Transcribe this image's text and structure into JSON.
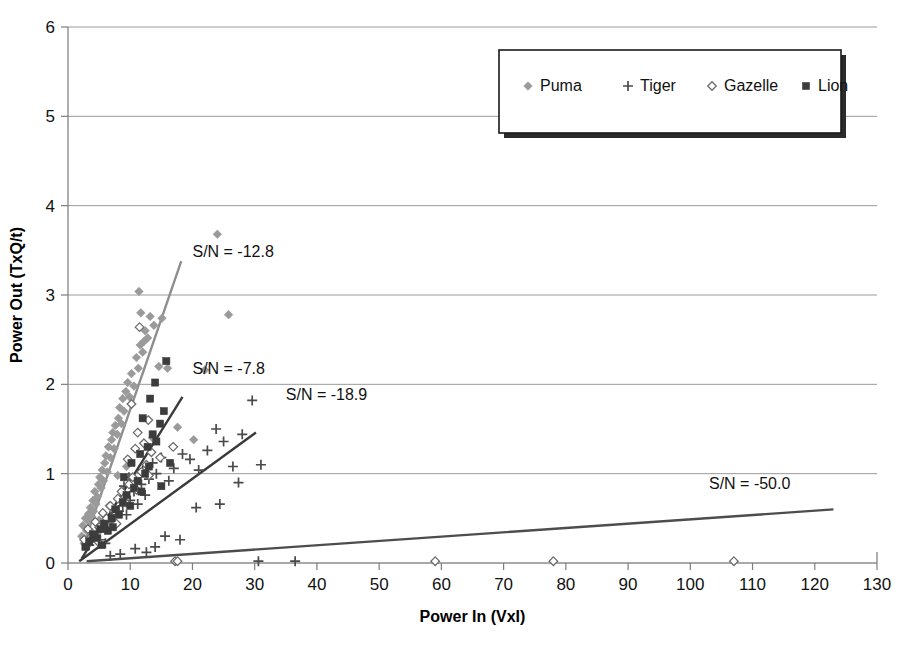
{
  "chart_data": {
    "type": "scatter",
    "title": "",
    "subtitle": "",
    "xlabel": "Power In (VxI)",
    "ylabel": "Power Out (TxQ/t)",
    "xlim": [
      0,
      130
    ],
    "ylim": [
      0,
      6
    ],
    "xticks": [
      0,
      10,
      20,
      30,
      40,
      50,
      60,
      70,
      80,
      90,
      100,
      110,
      120,
      130
    ],
    "yticks": [
      0,
      1,
      2,
      3,
      4,
      5,
      6
    ],
    "xtick_labels": [
      "0",
      "10",
      "20",
      "30",
      "40",
      "50",
      "60",
      "70",
      "80",
      "90",
      "100",
      "110",
      "120",
      "130"
    ],
    "ytick_labels": [
      "0",
      "1",
      "2",
      "3",
      "4",
      "5",
      "6"
    ],
    "grid": "horizontal",
    "legend_position": "top-right",
    "legend_entries": [
      {
        "label": "Puma",
        "marker": "filled-diamond",
        "color": "#9a9a9a"
      },
      {
        "label": "Tiger",
        "marker": "plus",
        "color": "#4a4a4a"
      },
      {
        "label": "Gazelle",
        "marker": "open-diamond",
        "color": "#6b6b6b"
      },
      {
        "label": "Lion",
        "marker": "filled-square",
        "color": "#3c3c3c"
      }
    ],
    "series": [
      {
        "name": "Puma",
        "marker": "filled-diamond",
        "color": "#9a9a9a",
        "points": [
          [
            2.2,
            0.3
          ],
          [
            2.4,
            0.42
          ],
          [
            2.6,
            0.22
          ],
          [
            2.8,
            0.5
          ],
          [
            3.0,
            0.36
          ],
          [
            3.1,
            0.28
          ],
          [
            3.3,
            0.55
          ],
          [
            3.4,
            0.46
          ],
          [
            3.6,
            0.62
          ],
          [
            3.8,
            0.52
          ],
          [
            4.0,
            0.7
          ],
          [
            4.1,
            0.58
          ],
          [
            4.3,
            0.8
          ],
          [
            4.5,
            0.66
          ],
          [
            4.7,
            0.74
          ],
          [
            4.9,
            0.88
          ],
          [
            5.1,
            0.96
          ],
          [
            5.3,
            0.84
          ],
          [
            5.5,
            1.04
          ],
          [
            5.7,
            0.92
          ],
          [
            5.9,
            1.12
          ],
          [
            6.1,
            1.2
          ],
          [
            6.3,
            1.02
          ],
          [
            6.5,
            1.3
          ],
          [
            6.8,
            1.18
          ],
          [
            7.0,
            1.38
          ],
          [
            7.2,
            1.46
          ],
          [
            7.4,
            1.28
          ],
          [
            7.6,
            1.54
          ],
          [
            7.9,
            1.44
          ],
          [
            8.1,
            1.62
          ],
          [
            8.3,
            1.74
          ],
          [
            8.6,
            1.56
          ],
          [
            8.8,
            1.84
          ],
          [
            9.0,
            1.7
          ],
          [
            9.3,
            1.92
          ],
          [
            9.6,
            2.02
          ],
          [
            9.9,
            1.86
          ],
          [
            10.2,
            2.12
          ],
          [
            10.6,
            1.98
          ],
          [
            11.0,
            2.3
          ],
          [
            11.3,
            2.18
          ],
          [
            11.6,
            2.44
          ],
          [
            12.0,
            2.36
          ],
          [
            12.4,
            2.6
          ],
          [
            12.8,
            2.52
          ],
          [
            13.2,
            2.76
          ],
          [
            13.8,
            2.66
          ],
          [
            11.4,
            3.04
          ],
          [
            11.7,
            2.8
          ],
          [
            12.2,
            2.48
          ],
          [
            14.6,
            2.2
          ],
          [
            16.0,
            2.18
          ],
          [
            15.1,
            2.74
          ],
          [
            17.6,
            1.52
          ],
          [
            20.2,
            1.38
          ],
          [
            24.0,
            3.68
          ],
          [
            25.8,
            2.78
          ],
          [
            22.0,
            2.16
          ],
          [
            13.6,
            1.4
          ],
          [
            9.4,
            1.08
          ],
          [
            8.0,
            0.98
          ],
          [
            6.6,
            0.64
          ],
          [
            5.0,
            0.48
          ],
          [
            3.9,
            0.34
          ]
        ]
      },
      {
        "name": "Tiger",
        "marker": "plus",
        "color": "#4a4a4a",
        "points": [
          [
            3.4,
            0.2
          ],
          [
            4.0,
            0.28
          ],
          [
            4.6,
            0.34
          ],
          [
            5.2,
            0.26
          ],
          [
            5.8,
            0.4
          ],
          [
            6.4,
            0.46
          ],
          [
            6.0,
            0.22
          ],
          [
            7.0,
            0.52
          ],
          [
            7.6,
            0.44
          ],
          [
            8.2,
            0.58
          ],
          [
            8.8,
            0.64
          ],
          [
            9.4,
            0.54
          ],
          [
            10.0,
            0.7
          ],
          [
            10.6,
            0.8
          ],
          [
            11.2,
            0.66
          ],
          [
            11.8,
            0.88
          ],
          [
            12.4,
            0.76
          ],
          [
            13.0,
            0.94
          ],
          [
            9.0,
            0.86
          ],
          [
            9.8,
            0.96
          ],
          [
            12.0,
            1.04
          ],
          [
            13.6,
            1.12
          ],
          [
            14.2,
            1.0
          ],
          [
            15.0,
            1.18
          ],
          [
            16.2,
            0.92
          ],
          [
            17.0,
            1.06
          ],
          [
            18.4,
            1.22
          ],
          [
            19.6,
            1.16
          ],
          [
            21.0,
            1.04
          ],
          [
            22.4,
            1.26
          ],
          [
            23.8,
            1.5
          ],
          [
            25.0,
            1.36
          ],
          [
            26.5,
            1.08
          ],
          [
            28.0,
            1.44
          ],
          [
            29.6,
            1.82
          ],
          [
            31.0,
            1.1
          ],
          [
            27.4,
            0.9
          ],
          [
            24.4,
            0.66
          ],
          [
            20.6,
            0.62
          ],
          [
            18.0,
            0.26
          ],
          [
            15.6,
            0.3
          ],
          [
            14.0,
            0.18
          ],
          [
            12.6,
            0.12
          ],
          [
            10.8,
            0.16
          ],
          [
            8.4,
            0.1
          ],
          [
            6.8,
            0.08
          ],
          [
            30.6,
            0.02
          ],
          [
            36.5,
            0.02
          ]
        ]
      },
      {
        "name": "Gazelle",
        "marker": "open-diamond",
        "color": "#6b6b6b",
        "points": [
          [
            2.6,
            0.26
          ],
          [
            3.2,
            0.38
          ],
          [
            3.8,
            0.3
          ],
          [
            4.4,
            0.46
          ],
          [
            5.0,
            0.4
          ],
          [
            5.6,
            0.56
          ],
          [
            6.2,
            0.5
          ],
          [
            6.8,
            0.64
          ],
          [
            7.4,
            0.58
          ],
          [
            8.0,
            0.72
          ],
          [
            8.6,
            0.8
          ],
          [
            9.2,
            0.68
          ],
          [
            9.8,
            0.88
          ],
          [
            10.4,
            0.96
          ],
          [
            11.0,
            0.82
          ],
          [
            11.8,
            1.02
          ],
          [
            12.6,
            1.1
          ],
          [
            9.6,
            1.16
          ],
          [
            10.8,
            1.28
          ],
          [
            12.2,
            1.34
          ],
          [
            13.4,
            1.24
          ],
          [
            11.2,
            1.46
          ],
          [
            12.9,
            1.6
          ],
          [
            10.2,
            1.78
          ],
          [
            11.5,
            2.64
          ],
          [
            16.9,
            1.3
          ],
          [
            14.8,
            1.18
          ],
          [
            13.0,
            0.98
          ],
          [
            7.8,
            0.44
          ],
          [
            4.8,
            0.24
          ],
          [
            17.2,
            0.02
          ],
          [
            17.6,
            0.02
          ],
          [
            59.0,
            0.02
          ],
          [
            78.0,
            0.02
          ],
          [
            107.0,
            0.02
          ]
        ]
      },
      {
        "name": "Lion",
        "marker": "filled-square",
        "color": "#3c3c3c",
        "points": [
          [
            2.8,
            0.18
          ],
          [
            3.4,
            0.24
          ],
          [
            4.0,
            0.32
          ],
          [
            4.6,
            0.28
          ],
          [
            5.2,
            0.38
          ],
          [
            5.8,
            0.44
          ],
          [
            6.4,
            0.36
          ],
          [
            7.0,
            0.5
          ],
          [
            7.6,
            0.6
          ],
          [
            8.2,
            0.54
          ],
          [
            8.8,
            0.68
          ],
          [
            9.4,
            0.76
          ],
          [
            10.0,
            0.64
          ],
          [
            10.6,
            0.84
          ],
          [
            11.2,
            0.92
          ],
          [
            11.8,
            0.8
          ],
          [
            12.4,
            1.0
          ],
          [
            13.0,
            1.08
          ],
          [
            9.0,
            0.96
          ],
          [
            10.2,
            1.12
          ],
          [
            11.6,
            1.22
          ],
          [
            12.8,
            1.3
          ],
          [
            13.6,
            1.44
          ],
          [
            14.2,
            1.36
          ],
          [
            14.8,
            1.56
          ],
          [
            15.4,
            1.7
          ],
          [
            13.2,
            1.84
          ],
          [
            14.0,
            2.02
          ],
          [
            12.0,
            1.62
          ],
          [
            15.8,
            2.26
          ],
          [
            16.4,
            1.12
          ],
          [
            15.0,
            0.86
          ],
          [
            7.2,
            0.4
          ],
          [
            5.4,
            0.2
          ]
        ]
      }
    ],
    "trendlines": [
      {
        "label": "S/N = -12.8",
        "color": "#8e8e8e",
        "x1": 2.5,
        "y1": 0.2,
        "x2": 18.2,
        "y2": 3.38,
        "label_x": 20.0,
        "label_y": 3.42
      },
      {
        "label": "S/N = -7.8",
        "color": "#3a3a3a",
        "x1": 2.2,
        "y1": 0.05,
        "x2": 18.4,
        "y2": 1.86,
        "label_x": 20.0,
        "label_y": 2.12
      },
      {
        "label": "S/N = -18.9",
        "color": "#3a3a3a",
        "x1": 1.8,
        "y1": 0.02,
        "x2": 30.2,
        "y2": 1.46,
        "label_x": 35.0,
        "label_y": 1.82
      },
      {
        "label": "S/N = -50.0",
        "color": "#4d4d4d",
        "x1": 3.0,
        "y1": 0.02,
        "x2": 123.0,
        "y2": 0.6,
        "label_x": 103.0,
        "label_y": 0.83
      }
    ]
  },
  "axes": {
    "x_title": "Power In (VxI)",
    "y_title": "Power Out (TxQ/t)"
  }
}
